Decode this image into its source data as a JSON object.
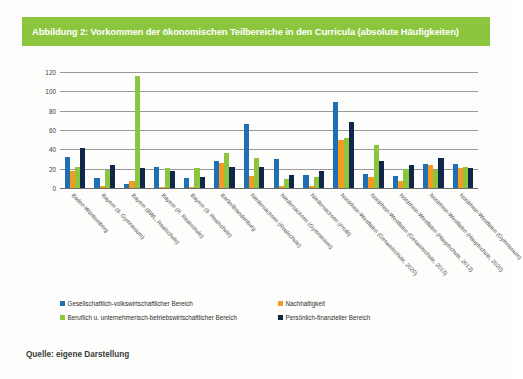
{
  "figure": {
    "title": "Abbildung 2: Vorkommen der ökonomischen Teilbereiche in den Curricula (absolute Häufigkeiten)",
    "source": "Quelle: eigene Darstellung",
    "title_band_color": "#8cc63e"
  },
  "legend": {
    "position": "bottom",
    "entries": [
      {
        "label": "Gesellschaftlich-volkswirtschaftlicher Bereich",
        "color": "#1f6fb4",
        "swatch": "s0"
      },
      {
        "label": "Nachhaltigkeit",
        "color": "#f59a22",
        "swatch": "s1"
      },
      {
        "label": "Beruflich u. unternehmerisch-betriebswirtschaftlicher Bereich",
        "color": "#8cc63e",
        "swatch": "s2"
      },
      {
        "label": "Persönlich-finanzieller Bereich",
        "color": "#10264b",
        "swatch": "s3"
      }
    ]
  },
  "axis": {
    "yticks": [
      "0",
      "20",
      "40",
      "60",
      "80",
      "100",
      "120"
    ]
  },
  "chart_data": {
    "type": "bar",
    "title": "Abbildung 2: Vorkommen der ökonomischen Teilbereiche in den Curricula (absolute Häufigkeiten)",
    "xlabel": "",
    "ylabel": "",
    "ylim": [
      0,
      120
    ],
    "yticks": [
      0,
      20,
      40,
      60,
      80,
      100,
      120
    ],
    "grid": true,
    "legend_position": "bottom",
    "categories": [
      "Baden-Württemberg",
      "Bayern (8. Gymnasium)",
      "Bayern (BWL, Realschule)",
      "Bayern (R. Realschule)",
      "Bayern (9. Realschule)",
      "Berlin/Brandenburg",
      "Niedersachsen (Realschule)",
      "Niedersachsen (Gymnasium)",
      "Niedersachsen (Profil)",
      "Nordrhein-Westfalen (Gesamtschule, 2020)",
      "Nordrhein-Westfalen (Gesamtschule, 2013)",
      "Nordrhein-Westfalen (Hauptschule, 2013)",
      "Nordrhein-Westfalen (Hauptschule, 2020)",
      "Nordrhein-Westfalen (Gymnasium)"
    ],
    "series": [
      {
        "name": "Gesellschaftlich-volkswirtschaftlicher Bereich",
        "color": "#1f6fb4",
        "values": [
          32,
          10,
          4,
          22,
          10,
          28,
          66,
          30,
          13,
          89,
          15,
          12,
          25,
          25
        ]
      },
      {
        "name": "Nachhaltigkeit",
        "color": "#f59a22",
        "values": [
          18,
          2,
          7,
          1,
          1,
          26,
          12,
          2,
          2,
          50,
          11,
          7,
          24,
          21
        ]
      },
      {
        "name": "Beruflich u. unternehmerisch-betriebswirtschaftlicher Bereich",
        "color": "#8cc63e",
        "values": [
          22,
          19,
          116,
          21,
          21,
          36,
          31,
          9,
          11,
          52,
          45,
          20,
          19,
          22
        ]
      },
      {
        "name": "Persönlich-finanzieller Bereich",
        "color": "#10264b",
        "values": [
          41,
          24,
          21,
          18,
          11,
          22,
          22,
          13,
          18,
          68,
          28,
          24,
          31,
          21
        ]
      }
    ]
  }
}
